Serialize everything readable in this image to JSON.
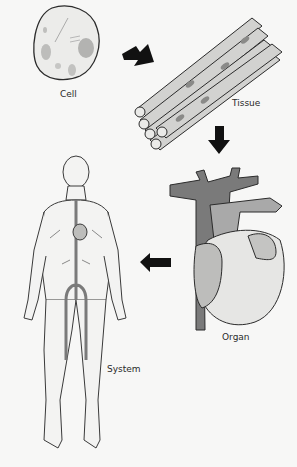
{
  "diagram": {
    "stages": [
      {
        "id": "cell",
        "label": "Cell"
      },
      {
        "id": "tissue",
        "label": "Tissue"
      },
      {
        "id": "organ",
        "label": "Organ"
      },
      {
        "id": "system",
        "label": "System"
      }
    ],
    "arrows": [
      {
        "from": "cell",
        "to": "tissue",
        "direction": "down-right"
      },
      {
        "from": "tissue",
        "to": "organ",
        "direction": "down"
      },
      {
        "from": "organ",
        "to": "system",
        "direction": "left"
      }
    ],
    "colors": {
      "outline": "#2b2b2b",
      "cell_fill": "#ececea",
      "tissue_fill": "#d2d2d0",
      "vessel_dark": "#7a7a7a",
      "vessel_mid": "#a9a9a9",
      "heart_light": "#e6e6e4",
      "arrow": "#111111",
      "background": "#f7f7f6"
    }
  }
}
